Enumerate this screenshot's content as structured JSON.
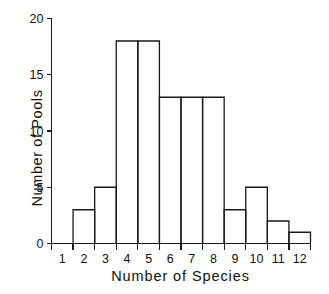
{
  "chart_data": {
    "type": "bar",
    "title": "",
    "subtitle": "",
    "xlabel": "Number of Species",
    "ylabel": "Number of Pools",
    "categories": [
      "1",
      "2",
      "3",
      "4",
      "5",
      "6",
      "7",
      "8",
      "9",
      "10",
      "11",
      "12"
    ],
    "values": [
      0,
      3,
      5,
      18,
      18,
      13,
      13,
      13,
      3,
      5,
      2,
      1
    ],
    "xlim": [
      0.5,
      12.5
    ],
    "ylim": [
      0,
      20
    ],
    "xticks": [
      0.5,
      1.5,
      2.5,
      3.5,
      4.5,
      5.5,
      6.5,
      7.5,
      8.5,
      9.5,
      10.5,
      11.5,
      12.5
    ],
    "xtick_labels": [
      "1",
      "2",
      "3",
      "4",
      "5",
      "6",
      "7",
      "8",
      "9",
      "10",
      "11",
      "12"
    ],
    "yticks": [
      0,
      5,
      10,
      15,
      20
    ],
    "ytick_labels": [
      "0",
      "5",
      "10",
      "15",
      "20"
    ],
    "grid": false,
    "legend": null,
    "bar_fill": "#ffffff",
    "bar_edge": "#1a1a1a",
    "axis_color": "#1a1a1a",
    "background": "#ffffff",
    "style": "histogram-outline"
  }
}
